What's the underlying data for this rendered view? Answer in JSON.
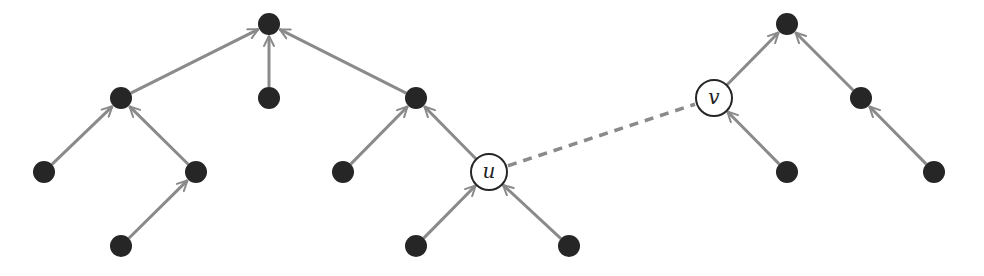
{
  "diagram": {
    "type": "forest",
    "colors": {
      "node_fill": "#262626",
      "edge": "#8a8a8a",
      "background": "#ffffff"
    },
    "nodes": [
      {
        "id": "A",
        "x": 269,
        "y": 24,
        "filled": true,
        "label": ""
      },
      {
        "id": "B",
        "x": 121,
        "y": 98,
        "filled": true,
        "label": ""
      },
      {
        "id": "C",
        "x": 269,
        "y": 98,
        "filled": true,
        "label": ""
      },
      {
        "id": "D",
        "x": 416,
        "y": 98,
        "filled": true,
        "label": ""
      },
      {
        "id": "E",
        "x": 44,
        "y": 172,
        "filled": true,
        "label": ""
      },
      {
        "id": "F",
        "x": 196,
        "y": 172,
        "filled": true,
        "label": ""
      },
      {
        "id": "G",
        "x": 121,
        "y": 246,
        "filled": true,
        "label": ""
      },
      {
        "id": "H",
        "x": 343,
        "y": 172,
        "filled": true,
        "label": ""
      },
      {
        "id": "u",
        "x": 489,
        "y": 172,
        "filled": false,
        "label": "u"
      },
      {
        "id": "I",
        "x": 416,
        "y": 246,
        "filled": true,
        "label": ""
      },
      {
        "id": "J",
        "x": 569,
        "y": 246,
        "filled": true,
        "label": ""
      },
      {
        "id": "K",
        "x": 787,
        "y": 24,
        "filled": true,
        "label": ""
      },
      {
        "id": "v",
        "x": 714,
        "y": 98,
        "filled": false,
        "label": "v"
      },
      {
        "id": "L",
        "x": 861,
        "y": 98,
        "filled": true,
        "label": ""
      },
      {
        "id": "M",
        "x": 787,
        "y": 172,
        "filled": true,
        "label": ""
      },
      {
        "id": "N",
        "x": 934,
        "y": 172,
        "filled": true,
        "label": ""
      }
    ],
    "edges": [
      {
        "from": "B",
        "to": "A",
        "style": "arrow"
      },
      {
        "from": "C",
        "to": "A",
        "style": "arrow"
      },
      {
        "from": "D",
        "to": "A",
        "style": "arrow"
      },
      {
        "from": "E",
        "to": "B",
        "style": "arrow"
      },
      {
        "from": "F",
        "to": "B",
        "style": "arrow"
      },
      {
        "from": "G",
        "to": "F",
        "style": "arrow"
      },
      {
        "from": "H",
        "to": "D",
        "style": "arrow"
      },
      {
        "from": "u",
        "to": "D",
        "style": "arrow"
      },
      {
        "from": "I",
        "to": "u",
        "style": "arrow"
      },
      {
        "from": "J",
        "to": "u",
        "style": "arrow"
      },
      {
        "from": "v",
        "to": "K",
        "style": "arrow"
      },
      {
        "from": "L",
        "to": "K",
        "style": "arrow"
      },
      {
        "from": "M",
        "to": "v",
        "style": "arrow"
      },
      {
        "from": "N",
        "to": "L",
        "style": "arrow"
      },
      {
        "from": "u",
        "to": "v",
        "style": "dashed"
      }
    ]
  }
}
